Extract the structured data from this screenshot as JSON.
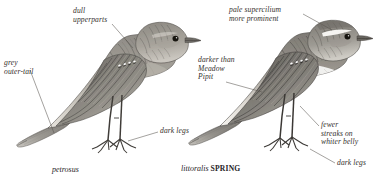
{
  "plate": {
    "background_color": "#ffffff",
    "ink_color": "#35312e",
    "style": "field-guide greyscale bird illustration plate"
  },
  "birds": [
    {
      "id": "left-bird",
      "name": "rock-pipit-petrosus",
      "caption_scientific": "petrosus",
      "caption_age": "",
      "facing": "right",
      "plumage": "dull grey-brown heavily streaked upperparts, dull streaked underparts, dark legs, grey outer tail"
    },
    {
      "id": "right-bird",
      "name": "rock-pipit-littoralis-spring",
      "caption_scientific": "littoralis",
      "caption_age": "SPRING",
      "facing": "right",
      "plumage": "pale supercilium, darker upperparts, fewer streaks on whiter belly, dark legs"
    }
  ],
  "captions": {
    "left": {
      "scientific": "petrosus",
      "age": ""
    },
    "right": {
      "scientific": "littoralis",
      "age": "SPRING"
    }
  },
  "labels": [
    {
      "id": "dull-upperparts",
      "text": "dull\nupperparts",
      "side": "left",
      "target": "mantle"
    },
    {
      "id": "grey-outer-tail",
      "text": "grey\nouter-tail",
      "side": "left",
      "target": "tail"
    },
    {
      "id": "dark-legs-left",
      "text": "dark legs",
      "side": "left",
      "target": "legs"
    },
    {
      "id": "pale-supercilium",
      "text": "pale supercilium\nmore prominent",
      "side": "right",
      "target": "supercilium"
    },
    {
      "id": "darker-than",
      "text": "darker than\nMeadow\nPipit",
      "side": "right",
      "target": "upperparts"
    },
    {
      "id": "fewer-streaks",
      "text": "fewer\nstreaks on\nwhiter belly",
      "side": "right",
      "target": "belly"
    },
    {
      "id": "dark-legs-right",
      "text": "dark legs",
      "side": "right",
      "target": "legs"
    }
  ]
}
